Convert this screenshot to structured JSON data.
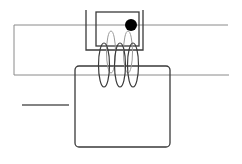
{
  "diagram": {
    "type": "electromagnet-induction-sketch",
    "colors": {
      "background": "#ffffff",
      "frame_line": "#8a8a8a",
      "dark_line": "#3a3a3a",
      "ball": "#000000"
    },
    "elements": [
      {
        "id": "outer-frame",
        "description": "thin grey rectangular loop of wire"
      },
      {
        "id": "u-bracket",
        "description": "U-shaped bracket at top"
      },
      {
        "id": "inner-box",
        "description": "small rectangle inside bracket"
      },
      {
        "id": "ball",
        "description": "black ball in top-right of inner box"
      },
      {
        "id": "coil",
        "description": "helical coil with three visible turns"
      },
      {
        "id": "base-box",
        "description": "large rounded rectangle below coil"
      },
      {
        "id": "left-bar",
        "description": "short horizontal line on the left"
      }
    ]
  }
}
